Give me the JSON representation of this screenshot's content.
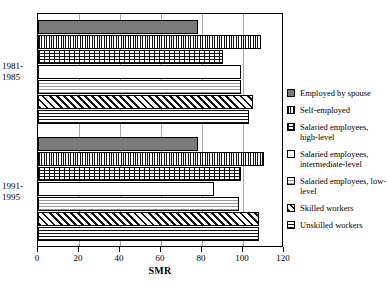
{
  "chart_data": {
    "type": "bar",
    "orientation": "horizontal",
    "title": "",
    "xlabel": "SMR",
    "ylabel": "",
    "xlim": [
      0,
      120
    ],
    "xticks": [
      0,
      20,
      40,
      60,
      80,
      100,
      120
    ],
    "xtick_labels": [
      "0",
      "20",
      "40",
      "60",
      "80",
      "100",
      "120"
    ],
    "grid": true,
    "legend_position": "right",
    "categories": [
      "1981-1985",
      "1991-1995"
    ],
    "category_lines": [
      [
        "1981-",
        "1985"
      ],
      [
        "1991-",
        "1995"
      ]
    ],
    "series": [
      {
        "name": "Employed by spouse",
        "values": [
          78,
          78
        ],
        "pattern": "solid-gray",
        "color": "#7a7a7a"
      },
      {
        "name": "Self-employed",
        "values": [
          109,
          110
        ],
        "pattern": "vertical-lines",
        "color": "#111111"
      },
      {
        "name": "Salaried employees, high-level",
        "values": [
          90,
          99
        ],
        "pattern": "brick",
        "color": "#111111"
      },
      {
        "name": "Salaried employees, intermediate-level",
        "values": [
          99,
          86
        ],
        "pattern": "white",
        "color": "#ffffff"
      },
      {
        "name": "Salaried employees, low-level",
        "values": [
          99,
          98
        ],
        "pattern": "horizontal-lines-light",
        "color": "#9a9a9a"
      },
      {
        "name": "Skilled workers",
        "values": [
          105,
          108
        ],
        "pattern": "diagonal-hatch",
        "color": "#111111"
      },
      {
        "name": "Unskilled workers",
        "values": [
          103,
          108
        ],
        "pattern": "horizontal-lines-dark",
        "color": "#111111"
      }
    ]
  },
  "legend": {
    "entries": [
      {
        "label": "Employed by spouse"
      },
      {
        "label": "Self-employed"
      },
      {
        "label": "Salaried employees, high-level"
      },
      {
        "label": "Salaried employees, intermediate-level"
      },
      {
        "label": "Salaried employees, low-level"
      },
      {
        "label": "Skilled workers"
      },
      {
        "label": "Unskilled workers"
      }
    ]
  },
  "axis": {
    "x_title": "SMR"
  }
}
